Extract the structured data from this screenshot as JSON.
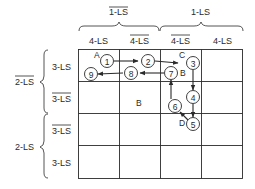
{
  "diagram": {
    "type": "karnaugh-map-state-sequence",
    "column_groups": [
      {
        "label": "1-LS",
        "negated": true,
        "span": [
          0,
          1
        ]
      },
      {
        "label": "1-LS",
        "negated": false,
        "span": [
          2,
          3
        ]
      }
    ],
    "column_headers": [
      {
        "label": "4-LS",
        "negated": false
      },
      {
        "label": "4-LS",
        "negated": true
      },
      {
        "label": "4-LS",
        "negated": true
      },
      {
        "label": "4-LS",
        "negated": false
      }
    ],
    "row_groups": [
      {
        "label": "2-LS",
        "negated": true,
        "span": [
          0,
          1
        ]
      },
      {
        "label": "2-LS",
        "negated": false,
        "span": [
          2,
          3
        ]
      }
    ],
    "row_headers": [
      {
        "label": "3-LS",
        "negated": false
      },
      {
        "label": "3-LS",
        "negated": true
      },
      {
        "label": "3-LS",
        "negated": true
      },
      {
        "label": "3-LS",
        "negated": false
      }
    ],
    "nodes": [
      {
        "id": "1",
        "label": "1",
        "cell": [
          0,
          0
        ]
      },
      {
        "id": "2",
        "label": "2",
        "cell": [
          0,
          1
        ]
      },
      {
        "id": "3",
        "label": "3",
        "cell": [
          0,
          2
        ]
      },
      {
        "id": "4",
        "label": "4",
        "cell": [
          1,
          2
        ]
      },
      {
        "id": "5",
        "label": "5",
        "cell": [
          1,
          2
        ]
      },
      {
        "id": "6",
        "label": "6",
        "cell": [
          1,
          2
        ]
      },
      {
        "id": "7",
        "label": "7",
        "cell": [
          0,
          2
        ]
      },
      {
        "id": "8",
        "label": "8",
        "cell": [
          0,
          1
        ]
      },
      {
        "id": "9",
        "label": "9",
        "cell": [
          0,
          0
        ]
      }
    ],
    "edges": [
      {
        "from": "1",
        "to": "2"
      },
      {
        "from": "2",
        "to": "3"
      },
      {
        "from": "3",
        "to": "4"
      },
      {
        "from": "4",
        "to": "5"
      },
      {
        "from": "5",
        "to": "6"
      },
      {
        "from": "6",
        "to": "7"
      },
      {
        "from": "7",
        "to": "8"
      },
      {
        "from": "8",
        "to": "9"
      }
    ],
    "point_labels": [
      {
        "label": "A",
        "near": "1"
      },
      {
        "label": "C",
        "near": "3"
      },
      {
        "label": "B",
        "near": "7"
      },
      {
        "label": "D",
        "near": "5"
      },
      {
        "label": "B",
        "cell": [
          1,
          1
        ]
      }
    ]
  }
}
